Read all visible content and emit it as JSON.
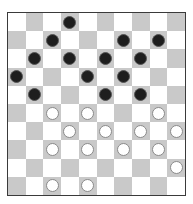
{
  "board": {
    "size": 10,
    "colors": {
      "light": "#ffffff",
      "dark": "#c9c9c9",
      "border": "#3a3a3a"
    },
    "pieces": {
      "black": [
        [
          0,
          3
        ],
        [
          1,
          2
        ],
        [
          1,
          6
        ],
        [
          1,
          8
        ],
        [
          2,
          1
        ],
        [
          2,
          3
        ],
        [
          2,
          5
        ],
        [
          2,
          7
        ],
        [
          3,
          0
        ],
        [
          3,
          4
        ],
        [
          3,
          6
        ],
        [
          4,
          1
        ],
        [
          4,
          5
        ],
        [
          4,
          7
        ]
      ],
      "white": [
        [
          5,
          2
        ],
        [
          5,
          4
        ],
        [
          5,
          8
        ],
        [
          6,
          3
        ],
        [
          6,
          5
        ],
        [
          6,
          7
        ],
        [
          6,
          9
        ],
        [
          7,
          2
        ],
        [
          7,
          4
        ],
        [
          7,
          6
        ],
        [
          7,
          8
        ],
        [
          8,
          9
        ],
        [
          9,
          2
        ],
        [
          9,
          4
        ]
      ]
    }
  }
}
